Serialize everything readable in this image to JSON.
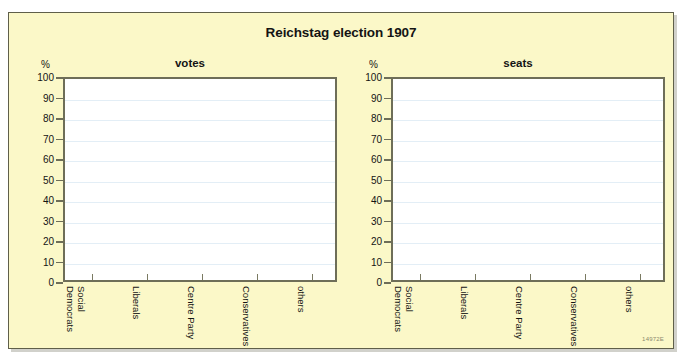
{
  "figure": {
    "title": "Reichstag election 1907",
    "code": "14972E",
    "background_color": "#fbf8c8",
    "plot_background_color": "#ffffff",
    "gridline_color": "#e3eef6",
    "axis_color": "#6e6e58"
  },
  "charts": [
    {
      "subtitle": "votes",
      "unit_label": "%",
      "y_ticks": [
        "100",
        "90",
        "80",
        "70",
        "60",
        "50",
        "40",
        "30",
        "20",
        "10",
        "0"
      ],
      "categories": [
        {
          "line1": "Social",
          "line2": "Democrats"
        },
        {
          "line1": "Liberals",
          "line2": ""
        },
        {
          "line1": "Centre Party",
          "line2": ""
        },
        {
          "line1": "Conservatives",
          "line2": ""
        },
        {
          "line1": "others",
          "line2": ""
        }
      ]
    },
    {
      "subtitle": "seats",
      "unit_label": "%",
      "y_ticks": [
        "100",
        "90",
        "80",
        "70",
        "60",
        "50",
        "40",
        "30",
        "20",
        "10",
        "0"
      ],
      "categories": [
        {
          "line1": "Social",
          "line2": "Democrats"
        },
        {
          "line1": "Liberals",
          "line2": ""
        },
        {
          "line1": "Centre Party",
          "line2": ""
        },
        {
          "line1": "Conservatives",
          "line2": ""
        },
        {
          "line1": "others",
          "line2": ""
        }
      ]
    }
  ],
  "chart_data": [
    {
      "type": "bar",
      "title": "votes",
      "xlabel": "",
      "ylabel": "%",
      "ylim": [
        0,
        100
      ],
      "yticks": [
        0,
        10,
        20,
        30,
        40,
        50,
        60,
        70,
        80,
        90,
        100
      ],
      "grid": true,
      "legend": "none",
      "categories": [
        "Social Democrats",
        "Liberals",
        "Centre Party",
        "Conservatives",
        "others"
      ],
      "values": [
        null,
        null,
        null,
        null,
        null
      ],
      "note": "Empty plot — axes drawn, no bars rendered"
    },
    {
      "type": "bar",
      "title": "seats",
      "xlabel": "",
      "ylabel": "%",
      "ylim": [
        0,
        100
      ],
      "yticks": [
        0,
        10,
        20,
        30,
        40,
        50,
        60,
        70,
        80,
        90,
        100
      ],
      "grid": true,
      "legend": "none",
      "categories": [
        "Social Democrats",
        "Liberals",
        "Centre Party",
        "Conservatives",
        "others"
      ],
      "values": [
        null,
        null,
        null,
        null,
        null
      ],
      "note": "Empty plot — axes drawn, no bars rendered"
    }
  ]
}
